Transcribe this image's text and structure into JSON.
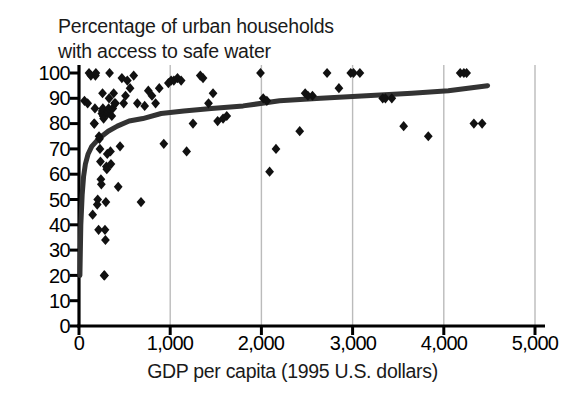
{
  "chart_data": {
    "type": "scatter",
    "title": "Percentage of urban households\nwith access to safe water",
    "title_line1": "Percentage of urban households",
    "title_line2": "with access to safe water",
    "xlabel": "GDP per capita (1995 U.S. dollars)",
    "ylabel": "",
    "xlim": [
      0,
      5000
    ],
    "ylim": [
      0,
      100
    ],
    "xticks": [
      0,
      1000,
      2000,
      3000,
      4000,
      5000
    ],
    "xtick_labels": [
      "0",
      "1,000",
      "2,000",
      "3,000",
      "4,000",
      "5,000"
    ],
    "yticks": [
      0,
      10,
      20,
      30,
      40,
      50,
      60,
      70,
      80,
      90,
      100
    ],
    "ytick_labels": [
      "0",
      "10",
      "20",
      "30",
      "40",
      "50",
      "60",
      "70",
      "80",
      "90",
      "100"
    ],
    "grid": "vertical-only",
    "gridline_color": "#bbbbbb",
    "marker": "diamond",
    "marker_color": "#111111",
    "marker_size": 7,
    "legend": "none",
    "series": [
      {
        "name": "Countries",
        "points": [
          [
            60,
            89
          ],
          [
            95,
            88
          ],
          [
            110,
            100
          ],
          [
            130,
            99
          ],
          [
            150,
            44
          ],
          [
            165,
            80
          ],
          [
            170,
            80
          ],
          [
            175,
            86
          ],
          [
            180,
            99
          ],
          [
            185,
            100
          ],
          [
            200,
            48
          ],
          [
            205,
            50
          ],
          [
            215,
            38
          ],
          [
            220,
            75
          ],
          [
            225,
            74
          ],
          [
            230,
            70
          ],
          [
            235,
            65
          ],
          [
            240,
            58
          ],
          [
            245,
            56
          ],
          [
            250,
            84
          ],
          [
            255,
            85
          ],
          [
            258,
            92
          ],
          [
            262,
            86
          ],
          [
            265,
            83
          ],
          [
            270,
            82
          ],
          [
            275,
            20
          ],
          [
            280,
            20
          ],
          [
            285,
            38
          ],
          [
            290,
            34
          ],
          [
            295,
            49
          ],
          [
            300,
            63
          ],
          [
            305,
            62
          ],
          [
            310,
            68
          ],
          [
            315,
            84
          ],
          [
            320,
            85
          ],
          [
            325,
            86
          ],
          [
            330,
            90
          ],
          [
            335,
            100
          ],
          [
            345,
            69
          ],
          [
            350,
            64
          ],
          [
            360,
            83
          ],
          [
            370,
            86
          ],
          [
            380,
            92
          ],
          [
            390,
            88
          ],
          [
            400,
            88
          ],
          [
            430,
            55
          ],
          [
            450,
            71
          ],
          [
            470,
            98
          ],
          [
            490,
            88
          ],
          [
            510,
            91
          ],
          [
            530,
            97
          ],
          [
            560,
            94
          ],
          [
            600,
            99
          ],
          [
            640,
            88
          ],
          [
            680,
            49
          ],
          [
            720,
            87
          ],
          [
            760,
            93
          ],
          [
            800,
            91
          ],
          [
            840,
            88
          ],
          [
            880,
            94
          ],
          [
            930,
            72
          ],
          [
            980,
            96
          ],
          [
            1010,
            97
          ],
          [
            1040,
            97
          ],
          [
            1080,
            98
          ],
          [
            1120,
            97
          ],
          [
            1180,
            69
          ],
          [
            1250,
            80
          ],
          [
            1330,
            99
          ],
          [
            1360,
            98
          ],
          [
            1420,
            88
          ],
          [
            1470,
            92
          ],
          [
            1520,
            81
          ],
          [
            1580,
            82
          ],
          [
            1620,
            83
          ],
          [
            1990,
            100
          ],
          [
            2020,
            90
          ],
          [
            2060,
            89
          ],
          [
            2090,
            61
          ],
          [
            2160,
            70
          ],
          [
            2420,
            77
          ],
          [
            2480,
            92
          ],
          [
            2510,
            91
          ],
          [
            2560,
            91
          ],
          [
            2720,
            100
          ],
          [
            2850,
            94
          ],
          [
            2980,
            100
          ],
          [
            3010,
            100
          ],
          [
            3080,
            100
          ],
          [
            3330,
            90
          ],
          [
            3360,
            90
          ],
          [
            3430,
            90
          ],
          [
            3560,
            79
          ],
          [
            3830,
            75
          ],
          [
            4180,
            100
          ],
          [
            4220,
            100
          ],
          [
            4250,
            100
          ],
          [
            4330,
            80
          ],
          [
            4420,
            80
          ]
        ]
      }
    ],
    "fit_curve": {
      "name": "Fitted logarithmic trend",
      "type": "log",
      "color": "#333333",
      "width": 5,
      "points": [
        [
          10,
          20
        ],
        [
          20,
          40
        ],
        [
          35,
          52
        ],
        [
          50,
          59
        ],
        [
          70,
          64
        ],
        [
          100,
          68
        ],
        [
          140,
          71
        ],
        [
          190,
          73
        ],
        [
          250,
          75
        ],
        [
          320,
          77
        ],
        [
          420,
          79
        ],
        [
          550,
          81
        ],
        [
          700,
          82
        ],
        [
          900,
          84
        ],
        [
          1150,
          85
        ],
        [
          1450,
          86
        ],
        [
          1800,
          87
        ],
        [
          2200,
          89
        ],
        [
          2650,
          90
        ],
        [
          3150,
          91
        ],
        [
          3650,
          92
        ],
        [
          4050,
          93
        ],
        [
          4480,
          95
        ]
      ]
    }
  }
}
